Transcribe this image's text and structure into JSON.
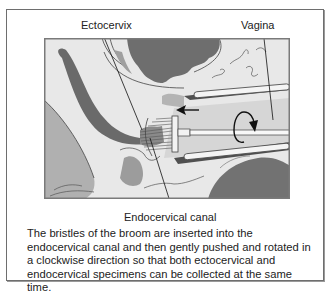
{
  "figure": {
    "labels": {
      "ectocervix": "Ectocervix",
      "vagina": "Vagina",
      "endocervical_canal": "Endocervical canal"
    },
    "caption": "The bristles of the broom are inserted into the endocervical canal and then gently pushed and rotated in a clockwise direction so that both ectocervical and endocervical specimens can be collected at the same time.",
    "illustration": {
      "subject": "cervical broom sampling device inserted into cervix",
      "indicators": [
        "push-arrow-icon",
        "clockwise-rotation-icon"
      ]
    },
    "colors": {
      "frame_border": "#6e6e6e",
      "illustration_bg": "#e6e6e6",
      "dark_tissue": "#6a6a6a",
      "mid_tissue": "#a8a8a8",
      "light_tissue": "#d2d2d2",
      "text": "#222222"
    }
  }
}
